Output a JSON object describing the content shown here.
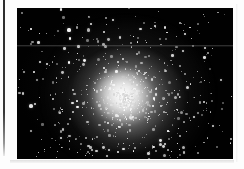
{
  "page": {
    "background_color": "#fdfdfd",
    "gutter_rule_color": "#1a1a1a"
  },
  "plate": {
    "label": "globular-cluster-photographic-plate",
    "background_color": "#010101",
    "frame": {
      "x": 17,
      "y": 8,
      "width": 216,
      "height": 151
    },
    "artifact_scanline_y": 45
  },
  "chart_data": {
    "type": "scatter",
    "title": "",
    "subtitle": "",
    "xlabel": "",
    "ylabel": "",
    "grid": false,
    "legend": null,
    "xlim": [
      0,
      216
    ],
    "ylim": [
      0,
      151
    ],
    "cluster": {
      "center_x": 110,
      "center_y": 92,
      "core_radius_px": 26,
      "half_light_radius_px": 44,
      "halo_radius_px": 86,
      "peak_brightness": 255,
      "background_level": 2
    },
    "series": [
      {
        "name": "core-unresolved-light",
        "kind": "glow",
        "center": [
          110,
          92
        ],
        "radius": 58,
        "peak_alpha": 0.92
      },
      {
        "name": "resolved-stars",
        "kind": "points",
        "count": 760,
        "size_range_px": [
          0.7,
          3.4
        ],
        "brightness_range": [
          0.25,
          1.0
        ]
      },
      {
        "name": "field-stars",
        "kind": "points",
        "count": 180,
        "size_range_px": [
          0.7,
          2.6
        ],
        "brightness_range": [
          0.2,
          0.95
        ]
      }
    ],
    "bright_stars": [
      {
        "x": 52,
        "y": 22,
        "size": 3.1,
        "brightness": 0.95
      },
      {
        "x": 74,
        "y": 16,
        "size": 2.8,
        "brightness": 0.92
      },
      {
        "x": 96,
        "y": 12,
        "size": 2.6,
        "brightness": 0.88
      },
      {
        "x": 138,
        "y": 18,
        "size": 2.9,
        "brightness": 0.93
      },
      {
        "x": 168,
        "y": 26,
        "size": 2.7,
        "brightness": 0.9
      },
      {
        "x": 188,
        "y": 40,
        "size": 2.5,
        "brightness": 0.86
      },
      {
        "x": 30,
        "y": 56,
        "size": 2.8,
        "brightness": 0.91
      },
      {
        "x": 18,
        "y": 96,
        "size": 2.6,
        "brightness": 0.87
      },
      {
        "x": 44,
        "y": 130,
        "size": 2.7,
        "brightness": 0.89
      },
      {
        "x": 92,
        "y": 142,
        "size": 2.5,
        "brightness": 0.85
      },
      {
        "x": 148,
        "y": 136,
        "size": 2.8,
        "brightness": 0.9
      },
      {
        "x": 196,
        "y": 118,
        "size": 2.4,
        "brightness": 0.84
      },
      {
        "x": 204,
        "y": 72,
        "size": 2.3,
        "brightness": 0.8
      }
    ]
  }
}
